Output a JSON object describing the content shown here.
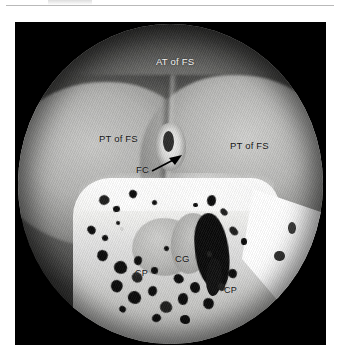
{
  "page": {
    "background_color": "#ffffff",
    "rule_color": "#b9b9b9"
  },
  "figure": {
    "plate_color": "#000000",
    "modality": "endoscopic photograph",
    "field_of_view": "circular"
  },
  "annotations": {
    "at_of_fs": {
      "text": "AT of FS",
      "full": "Anterior Table of Frontal Sinus",
      "color": "#f2f2f0",
      "style": "light"
    },
    "pt_of_fs_left": {
      "text": "PT of FS",
      "full": "Posterior Table of Frontal Sinus",
      "color": "#141414",
      "style": "dark"
    },
    "pt_of_fs_right": {
      "text": "PT of FS",
      "full": "Posterior Table of Frontal Sinus",
      "color": "#141414",
      "style": "dark"
    },
    "fc": {
      "text": "FC",
      "full": "Frontal Sinus Cell / Frontal Crest",
      "color": "#141414",
      "style": "dark",
      "has_arrow": true,
      "arrow_direction": "up-right",
      "arrow_color": "#000000"
    },
    "cg": {
      "text": "CG",
      "full": "Crista Galli",
      "color": "#141414",
      "style": "dark"
    },
    "cp_left": {
      "text": "CP",
      "full": "Cribriform Plate",
      "color": "#141414",
      "style": "dark"
    },
    "cp_right": {
      "text": "CP",
      "full": "Cribriform Plate",
      "color": "#141414",
      "style": "dark"
    }
  },
  "pores": [
    {
      "x": 26.5,
      "y": 53.5,
      "w": 3.4,
      "h": 3.0
    },
    {
      "x": 31.0,
      "y": 57.0,
      "w": 2.2,
      "h": 2.0
    },
    {
      "x": 36.5,
      "y": 51.8,
      "w": 2.6,
      "h": 2.4
    },
    {
      "x": 44.0,
      "y": 55.0,
      "w": 1.8,
      "h": 1.6
    },
    {
      "x": 62.0,
      "y": 53.5,
      "w": 2.8,
      "h": 3.4
    },
    {
      "x": 66.5,
      "y": 57.5,
      "w": 2.0,
      "h": 2.6
    },
    {
      "x": 57.5,
      "y": 56.0,
      "w": 1.5,
      "h": 1.4
    },
    {
      "x": 22.5,
      "y": 63.0,
      "w": 3.0,
      "h": 2.4
    },
    {
      "x": 27.5,
      "y": 66.0,
      "w": 2.0,
      "h": 1.8
    },
    {
      "x": 32.0,
      "y": 61.5,
      "w": 1.4,
      "h": 1.3
    },
    {
      "x": 69.5,
      "y": 63.0,
      "w": 2.4,
      "h": 3.0
    },
    {
      "x": 73.0,
      "y": 67.0,
      "w": 2.0,
      "h": 2.2
    },
    {
      "x": 26.0,
      "y": 70.5,
      "w": 3.6,
      "h": 3.4
    },
    {
      "x": 31.5,
      "y": 74.0,
      "w": 4.2,
      "h": 4.0
    },
    {
      "x": 38.0,
      "y": 72.5,
      "w": 2.6,
      "h": 2.8
    },
    {
      "x": 37.5,
      "y": 77.5,
      "w": 3.2,
      "h": 3.4
    },
    {
      "x": 43.5,
      "y": 76.0,
      "w": 2.4,
      "h": 2.2
    },
    {
      "x": 30.5,
      "y": 80.0,
      "w": 3.8,
      "h": 3.6
    },
    {
      "x": 36.0,
      "y": 83.5,
      "w": 4.4,
      "h": 4.2
    },
    {
      "x": 42.5,
      "y": 82.0,
      "w": 3.0,
      "h": 3.2
    },
    {
      "x": 46.5,
      "y": 86.5,
      "w": 4.0,
      "h": 3.8
    },
    {
      "x": 52.5,
      "y": 84.0,
      "w": 3.4,
      "h": 3.6
    },
    {
      "x": 51.0,
      "y": 78.0,
      "w": 2.8,
      "h": 3.0
    },
    {
      "x": 56.5,
      "y": 80.5,
      "w": 3.2,
      "h": 3.4
    },
    {
      "x": 60.5,
      "y": 85.5,
      "w": 3.6,
      "h": 3.4
    },
    {
      "x": 65.5,
      "y": 81.0,
      "w": 2.4,
      "h": 2.6
    },
    {
      "x": 69.0,
      "y": 76.5,
      "w": 3.0,
      "h": 2.8
    },
    {
      "x": 44.0,
      "y": 90.5,
      "w": 3.0,
      "h": 2.6
    },
    {
      "x": 53.0,
      "y": 91.0,
      "w": 3.4,
      "h": 2.8
    },
    {
      "x": 33.0,
      "y": 88.0,
      "w": 2.2,
      "h": 2.0
    },
    {
      "x": 62.0,
      "y": 71.0,
      "w": 1.8,
      "h": 2.0
    },
    {
      "x": 48.0,
      "y": 69.5,
      "w": 1.6,
      "h": 1.5
    }
  ]
}
